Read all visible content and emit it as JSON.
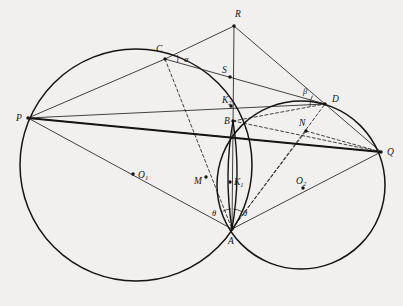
{
  "figure": {
    "kind": "geometry-diagram",
    "background_color": "#f2f0ee",
    "ink_color": "#141414",
    "width": 403,
    "height": 306,
    "circles": [
      {
        "name": "circle-left",
        "cx": 136,
        "cy": 165,
        "r": 116,
        "stroke": "#141414",
        "stroke_width": 1.5
      },
      {
        "name": "circle-right",
        "cx": 301,
        "cy": 185,
        "r": 84,
        "stroke": "#141414",
        "stroke_width": 1.5
      },
      {
        "name": "lens-arc-left",
        "note": "small vertical lens arc through B and A",
        "stroke": "#141414"
      },
      {
        "name": "lens-arc-right",
        "note": "small vertical lens arc through B and A",
        "stroke": "#141414"
      }
    ],
    "points": [
      {
        "id": "P",
        "label": "P",
        "x": 28,
        "y": 118,
        "label_x": 16,
        "label_y": 121,
        "dot": true
      },
      {
        "id": "C",
        "label": "C",
        "x": 165,
        "y": 59,
        "label_x": 156,
        "label_y": 52,
        "dot": true
      },
      {
        "id": "R",
        "label": "R",
        "x": 234,
        "y": 26,
        "label_x": 235,
        "label_y": 17,
        "dot": true
      },
      {
        "id": "S",
        "label": "S",
        "x": 230,
        "y": 77,
        "label_x": 222,
        "label_y": 73,
        "dot": true
      },
      {
        "id": "K2",
        "label": "K",
        "sub": "2",
        "x": 231,
        "y": 106,
        "label_x": 222,
        "label_y": 103,
        "dot": true
      },
      {
        "id": "B",
        "label": "B",
        "x": 233,
        "y": 121,
        "label_x": 224,
        "label_y": 124,
        "dot": true
      },
      {
        "id": "D",
        "label": "D",
        "x": 325,
        "y": 104,
        "label_x": 332,
        "label_y": 102,
        "dot": true
      },
      {
        "id": "N",
        "label": "N",
        "x": 306,
        "y": 131,
        "label_x": 299,
        "label_y": 126,
        "dot": true
      },
      {
        "id": "Q",
        "label": "Q",
        "x": 381,
        "y": 152,
        "label_x": 387,
        "label_y": 155,
        "dot": true
      },
      {
        "id": "O1",
        "label": "O",
        "sub": "1",
        "x": 133,
        "y": 174,
        "label_x": 138,
        "label_y": 178,
        "dot": true
      },
      {
        "id": "M",
        "label": "M",
        "x": 206,
        "y": 177,
        "label_x": 194,
        "label_y": 184,
        "dot": true
      },
      {
        "id": "K1",
        "label": "K",
        "sub": "1",
        "x": 230,
        "y": 182,
        "label_x": 234,
        "label_y": 185,
        "dot": true
      },
      {
        "id": "O2",
        "label": "O",
        "sub": "2",
        "x": 303,
        "y": 188,
        "label_x": 296,
        "label_y": 184,
        "dot": true
      },
      {
        "id": "A",
        "label": "A",
        "x": 232,
        "y": 229,
        "label_x": 228,
        "label_y": 244,
        "dot": true
      }
    ],
    "angles": [
      {
        "id": "alpha",
        "label": "α",
        "at": "C",
        "label_x": 184,
        "label_y": 62
      },
      {
        "id": "beta",
        "label": "β",
        "at": "D",
        "label_x": 303,
        "label_y": 94
      },
      {
        "id": "theta-l",
        "label": "θ",
        "at": "A",
        "label_x": 212,
        "label_y": 216
      },
      {
        "id": "theta-r",
        "label": "θ",
        "at": "A",
        "label_x": 243,
        "label_y": 216
      }
    ],
    "solid_thin_segments": [
      {
        "name": "seg-P-C",
        "from": "P",
        "to": "C"
      },
      {
        "name": "seg-C-R",
        "from": "C",
        "to": "R"
      },
      {
        "name": "seg-R-D",
        "from": "R",
        "to": "D"
      },
      {
        "name": "seg-R-A",
        "from": "R",
        "to": "A"
      },
      {
        "name": "seg-C-D",
        "from": "C",
        "to": "D"
      },
      {
        "name": "seg-D-Q",
        "from": "D",
        "to": "Q"
      },
      {
        "name": "seg-P-A",
        "from": "P",
        "to": "A"
      },
      {
        "name": "seg-A-Q",
        "from": "A",
        "to": "Q"
      },
      {
        "name": "seg-P-S-D",
        "from": "P",
        "to": "D"
      }
    ],
    "solid_thick_segments": [
      {
        "name": "seg-P-Q",
        "from": "P",
        "to": "Q"
      }
    ],
    "dashed_segments": [
      {
        "name": "dash-C-A",
        "from": "C",
        "to": "A"
      },
      {
        "name": "dash-P-M-Q",
        "from": "P",
        "to": "Q",
        "via": "M"
      },
      {
        "name": "dash-B-D",
        "from": "B",
        "to": "D"
      },
      {
        "name": "dash-A-D",
        "from": "A",
        "to": "D"
      },
      {
        "name": "dash-B-Q",
        "from": "B",
        "to": "Q"
      },
      {
        "name": "dash-N-Q",
        "from": "N",
        "to": "Q"
      },
      {
        "name": "dash-A-N",
        "from": "A",
        "to": "N"
      }
    ]
  }
}
